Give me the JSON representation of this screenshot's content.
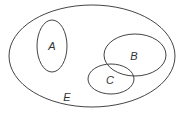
{
  "diagram": {
    "type": "venn",
    "universe": {
      "label": "E",
      "cx": 92,
      "cy": 56,
      "rx": 83,
      "ry": 51,
      "label_x": 67,
      "label_y": 101
    },
    "sets": [
      {
        "label": "A",
        "cx": 52,
        "cy": 46,
        "rx": 15,
        "ry": 26,
        "label_x": 52,
        "label_y": 50
      },
      {
        "label": "B",
        "cx": 135,
        "cy": 55,
        "rx": 31,
        "ry": 21,
        "label_x": 134,
        "label_y": 60
      },
      {
        "label": "C",
        "cx": 111,
        "cy": 79,
        "rx": 23,
        "ry": 15,
        "label_x": 110,
        "label_y": 84
      }
    ],
    "stroke_color": "#444444"
  }
}
